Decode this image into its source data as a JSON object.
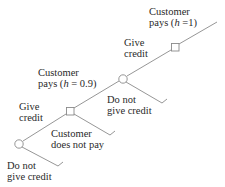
{
  "diagram": {
    "type": "decision-tree",
    "colors": {
      "line": "#8a8a8a",
      "text": "#2a2a2a",
      "background": "#ffffff"
    },
    "nodes": [
      {
        "id": "decision-1",
        "shape": "circle"
      },
      {
        "id": "chance-1",
        "shape": "square"
      },
      {
        "id": "decision-2",
        "shape": "circle"
      },
      {
        "id": "chance-2",
        "shape": "square"
      }
    ],
    "labels": {
      "do_not_give_credit_1_line1": "Do not",
      "do_not_give_credit_1_line2": "give credit",
      "give_credit_1_line1": "Give",
      "give_credit_1_line2": "credit",
      "customer_does_not_pay_line1": "Customer",
      "customer_does_not_pay_line2": "does not pay",
      "customer_pays_1_line1": "Customer",
      "customer_pays_1_prefix": "pays (",
      "customer_pays_1_var": "h",
      "customer_pays_1_suffix": " = 0.9)",
      "do_not_give_credit_2_line1": "Do not",
      "do_not_give_credit_2_line2": "give credit",
      "give_credit_2_line1": "Give",
      "give_credit_2_line2": "credit",
      "customer_pays_2_line1": "Customer",
      "customer_pays_2_prefix": "pays (",
      "customer_pays_2_var": "h",
      "customer_pays_2_suffix": " =1)"
    }
  }
}
